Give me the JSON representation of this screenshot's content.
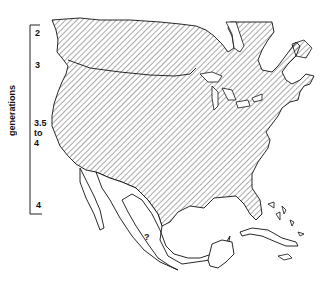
{
  "legend": {
    "title": "generations",
    "labels": [
      {
        "text": "2",
        "top": 28
      },
      {
        "text": "3",
        "top": 60
      },
      {
        "text": "3.5\nto\n4",
        "top": 119
      },
      {
        "text": "4",
        "top": 200
      }
    ]
  },
  "map": {
    "region": "North America",
    "hatched_area": "United States and southern Canada",
    "unknown_marker": "?",
    "colors": {
      "line": "#111111",
      "hatch": "#555555",
      "background": "#ffffff"
    }
  }
}
